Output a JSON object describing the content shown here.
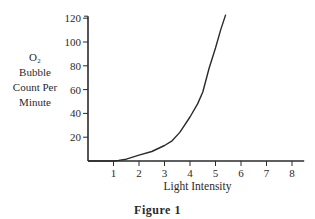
{
  "figure_caption": "Figure 1",
  "chart_data": {
    "type": "line",
    "title": "Figure 1",
    "xlabel": "Light Intensity",
    "ylabel_lines": [
      "O₂",
      "Bubble",
      "Count Per",
      "Minute"
    ],
    "ylabel": "O₂ Bubble Count Per Minute",
    "x_ticks": [
      1,
      2,
      3,
      4,
      5,
      6,
      7,
      8
    ],
    "y_ticks": [
      20,
      40,
      60,
      80,
      100,
      120
    ],
    "xlim": [
      0,
      8.4
    ],
    "ylim": [
      0,
      120
    ],
    "grid": false,
    "legend": null,
    "series": [
      {
        "name": "O₂ bubble count",
        "x": [
          0,
          1,
          1.2,
          1.5,
          2,
          2.5,
          3,
          3.3,
          3.6,
          4,
          4.3,
          4.5,
          4.75,
          5,
          5.2,
          5.4
        ],
        "y": [
          0,
          0,
          0.5,
          1.5,
          5,
          8,
          13,
          17,
          24,
          37,
          48,
          58,
          78,
          95,
          110,
          123
        ]
      }
    ]
  },
  "colors": {
    "line": "#2a2a2a",
    "axis": "#2a2a2a",
    "background": "#ffffff"
  }
}
